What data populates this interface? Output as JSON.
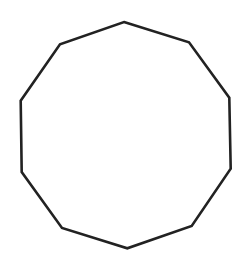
{
  "diagram": {
    "shape": "decagon",
    "sides": 10,
    "stroke_color": "#222222",
    "fill_color": "#ffffff",
    "stroke_width": 2.6,
    "vertices": [
      [
        124,
        22
      ],
      [
        189,
        42.3
      ],
      [
        229.3,
        97.7
      ],
      [
        230.7,
        168.7
      ],
      [
        191.7,
        226
      ],
      [
        127.3,
        248.3
      ],
      [
        62,
        228
      ],
      [
        21.7,
        172
      ],
      [
        20.7,
        100.7
      ],
      [
        60,
        44.3
      ]
    ]
  }
}
